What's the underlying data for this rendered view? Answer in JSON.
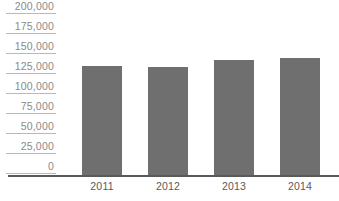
{
  "chart_data": {
    "type": "bar",
    "title": "",
    "xlabel": "",
    "ylabel": "",
    "categories": [
      "2011",
      "2012",
      "2013",
      "2014"
    ],
    "values": [
      136000,
      134000,
      143000,
      145000
    ],
    "ylim": [
      0,
      200000
    ],
    "ytick_values": [
      200000,
      175000,
      150000,
      125000,
      100000,
      75000,
      50000,
      25000,
      0
    ],
    "ytick_labels": [
      "200,000",
      "175,000",
      "150,000",
      "125,000",
      "100,000",
      "75,000",
      "50,000",
      "25,000",
      "0"
    ],
    "grid": "y-axis label underlines only",
    "legend": "none",
    "colors": {
      "bar": "#706f6f",
      "axis_line": "#58595b",
      "gridline": "#b9b9b9",
      "y_label_text": "#8a8a8a",
      "x_label_text": "#58595b",
      "background": "#ffffff"
    }
  }
}
